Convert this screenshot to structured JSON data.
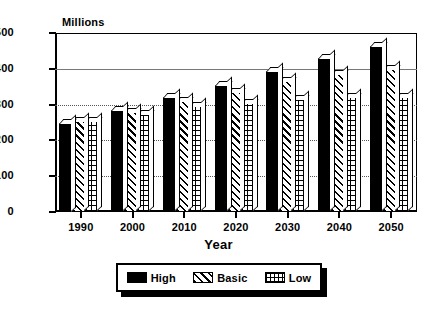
{
  "chart_data": {
    "type": "bar",
    "title": "",
    "xlabel": "Year",
    "ylabel": "Millions",
    "ylim": [
      0,
      500
    ],
    "ytick_values": [
      0,
      100,
      200,
      300,
      400,
      500
    ],
    "ytick_labels": [
      "0",
      "100",
      "200",
      "300",
      "400",
      "500"
    ],
    "grid": true,
    "grid_axis": "y",
    "legend_position": "bottom",
    "categories": [
      "1990",
      "2000",
      "2010",
      "2020",
      "2030",
      "2040",
      "2050"
    ],
    "series": [
      {
        "name": "High",
        "pattern": "solid-black",
        "color": "#000000",
        "values": [
          250,
          285,
          320,
          355,
          395,
          430,
          465
        ]
      },
      {
        "name": "Basic",
        "pattern": "diagonal-hatch",
        "color": "#ffffff",
        "values": [
          255,
          280,
          310,
          335,
          365,
          385,
          400
        ]
      },
      {
        "name": "Low",
        "pattern": "crosshatch-grid",
        "color": "#ffffff",
        "values": [
          255,
          275,
          295,
          305,
          315,
          320,
          322
        ]
      }
    ]
  },
  "axes": {
    "y_title": "Millions",
    "x_title": "Year"
  },
  "legend": {
    "items": [
      {
        "label": "High",
        "pattern": "solid-black"
      },
      {
        "label": "Basic",
        "pattern": "diagonal-hatch"
      },
      {
        "label": "Low",
        "pattern": "crosshatch-grid"
      }
    ]
  }
}
